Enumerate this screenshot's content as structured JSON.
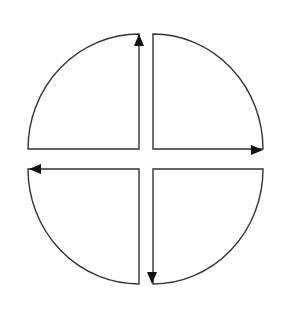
{
  "diagram": {
    "type": "quadrant-cycle",
    "colors": {
      "stroke": "#333333",
      "arrowhead": "#111111",
      "fill": "#ffffff",
      "background": "#ffffff"
    },
    "quadrants": [
      {
        "id": "top-left",
        "arrow_direction": "up",
        "icon": "arrow-up-icon"
      },
      {
        "id": "top-right",
        "arrow_direction": "right",
        "icon": "arrow-right-icon"
      },
      {
        "id": "bottom-right",
        "arrow_direction": "down",
        "icon": "arrow-down-icon"
      },
      {
        "id": "bottom-left",
        "arrow_direction": "left",
        "icon": "arrow-left-icon"
      }
    ]
  }
}
